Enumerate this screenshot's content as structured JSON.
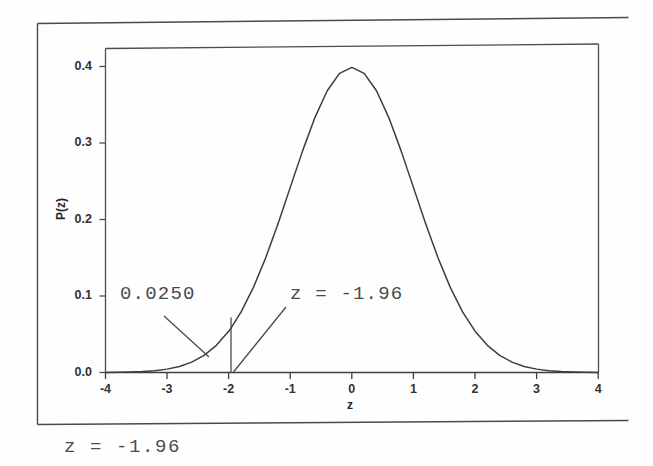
{
  "figure": {
    "caption": "z = -1.96",
    "background_color": "#ffffff",
    "ink_color": "#3a3a3a"
  },
  "chart_data": {
    "type": "line",
    "title": "",
    "subtitle": "",
    "xlabel": "z",
    "ylabel": "P(z)",
    "xlim": [
      -4,
      4
    ],
    "ylim": [
      0.0,
      0.42
    ],
    "grid": false,
    "legend": "none",
    "curve_name": "standard normal density",
    "xticks": [
      "-4",
      "-3",
      "-2",
      "-1",
      "0",
      "1",
      "2",
      "3",
      "4"
    ],
    "xtick_values": [
      -4,
      -3,
      -2,
      -1,
      0,
      1,
      2,
      3,
      4
    ],
    "yticks": [
      "0.0",
      "0.1",
      "0.2",
      "0.3",
      "0.4"
    ],
    "ytick_values": [
      0.0,
      0.1,
      0.2,
      0.3,
      0.4
    ],
    "peak": {
      "x": 0,
      "y": 0.3989
    },
    "x": [
      -4.0,
      -3.8,
      -3.6,
      -3.4,
      -3.2,
      -3.0,
      -2.8,
      -2.6,
      -2.4,
      -2.2,
      -2.0,
      -1.96,
      -1.8,
      -1.6,
      -1.4,
      -1.2,
      -1.0,
      -0.8,
      -0.6,
      -0.4,
      -0.2,
      0.0,
      0.2,
      0.4,
      0.6,
      0.8,
      1.0,
      1.2,
      1.4,
      1.6,
      1.8,
      2.0,
      2.2,
      2.4,
      2.6,
      2.8,
      3.0,
      3.2,
      3.4,
      3.6,
      3.8,
      4.0
    ],
    "y": [
      0.0001,
      0.0003,
      0.0006,
      0.0012,
      0.0024,
      0.0044,
      0.0079,
      0.0136,
      0.0224,
      0.0355,
      0.054,
      0.0584,
      0.079,
      0.1109,
      0.1497,
      0.1942,
      0.242,
      0.2897,
      0.3332,
      0.3683,
      0.391,
      0.3989,
      0.391,
      0.3683,
      0.3332,
      0.2897,
      0.242,
      0.1942,
      0.1497,
      0.1109,
      0.079,
      0.054,
      0.0355,
      0.0224,
      0.0136,
      0.0079,
      0.0044,
      0.0024,
      0.0012,
      0.0006,
      0.0003,
      0.0001
    ],
    "annotations": [
      {
        "name": "tail-area",
        "text": "0.0250",
        "meaning": "area of left tail below z = -1.96",
        "value": 0.025,
        "points_to": {
          "x": -2.26,
          "y": 0.018
        }
      },
      {
        "name": "critical-value",
        "text": "z = -1.96",
        "meaning": "critical z value marking the left tail boundary",
        "value": -1.96,
        "points_to": {
          "x": -1.96,
          "y": 0.0
        }
      }
    ],
    "markers": [
      {
        "name": "critical-value-line",
        "type": "vertical-segment",
        "x": -1.96,
        "y_from": 0.0,
        "y_to": 0.072
      }
    ]
  }
}
